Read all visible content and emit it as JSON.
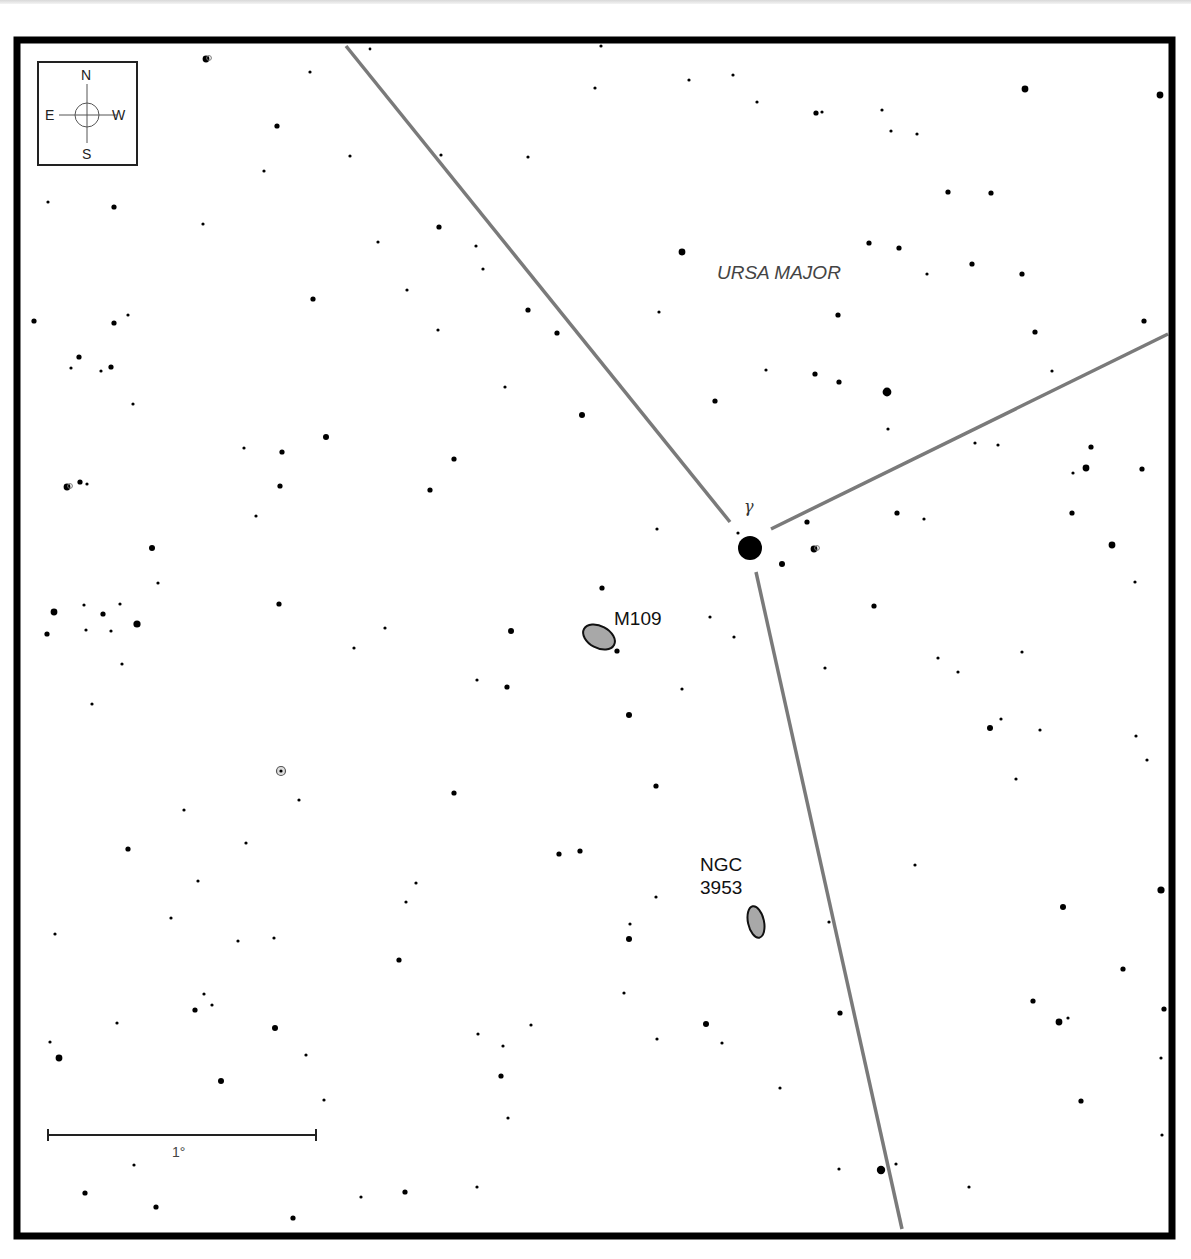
{
  "chart_title": "",
  "compass": {
    "north": "N",
    "south": "S",
    "east": "E",
    "west": "W"
  },
  "constellation": {
    "label": "URSA MAJOR",
    "x": 790,
    "y": 273
  },
  "scale_bar": {
    "label": "1°",
    "x1": 48,
    "x2": 316,
    "y": 1135
  },
  "frame": {
    "left": 17,
    "top": 40,
    "right": 1172,
    "bottom": 1236,
    "stroke": "#000000",
    "width": 7
  },
  "boundary_lines": {
    "color": "#7a7a7a",
    "segments": [
      {
        "x1": 346,
        "y1": 46,
        "x2": 730,
        "y2": 522
      },
      {
        "x1": 771,
        "y1": 529,
        "x2": 1168,
        "y2": 334
      },
      {
        "x1": 756,
        "y1": 572,
        "x2": 902,
        "y2": 1229
      }
    ]
  },
  "labeled_star": {
    "name": "γ",
    "x": 750,
    "y": 548,
    "r": 12,
    "label_x": 744,
    "label_y": 499
  },
  "deep_sky_objects": [
    {
      "name": "M109",
      "label_lines": [
        "M109"
      ],
      "x": 599,
      "y": 637,
      "rx": 17,
      "ry": 11,
      "rotate": 28,
      "label_x": 614,
      "label_y": 609,
      "fill": "#a8a8a8"
    },
    {
      "name": "NGC 3953",
      "label_lines": [
        "NGC",
        "3953"
      ],
      "x": 756,
      "y": 922,
      "rx": 8,
      "ry": 16,
      "rotate": -12,
      "label_x": 700,
      "label_y": 855,
      "fill": "#a8a8a8"
    }
  ],
  "special_markers": [
    {
      "type": "ring-star",
      "x": 281,
      "y": 771
    },
    {
      "type": "double-star",
      "x": 206,
      "y": 59
    },
    {
      "type": "double-star",
      "x": 67,
      "y": 487
    },
    {
      "type": "double-star",
      "x": 814,
      "y": 549
    }
  ],
  "stars": [
    [
      310,
      72,
      1.6
    ],
    [
      350,
      156,
      1.6
    ],
    [
      370,
      49,
      1.4
    ],
    [
      277,
      126,
      2.6
    ],
    [
      264,
      171,
      1.6
    ],
    [
      203,
      224,
      1.6
    ],
    [
      114,
      207,
      2.6
    ],
    [
      48,
      202,
      1.6
    ],
    [
      441,
      155,
      1.6
    ],
    [
      528,
      157,
      1.6
    ],
    [
      601,
      46,
      1.6
    ],
    [
      595,
      88,
      1.6
    ],
    [
      689,
      80,
      1.6
    ],
    [
      733,
      75,
      1.6
    ],
    [
      757,
      102,
      1.6
    ],
    [
      816,
      113,
      2.6
    ],
    [
      822,
      112,
      1.6
    ],
    [
      882,
      110,
      1.6
    ],
    [
      891,
      131,
      1.6
    ],
    [
      917,
      134,
      1.6
    ],
    [
      1025,
      89,
      3.4
    ],
    [
      1160,
      95,
      3.4
    ],
    [
      948,
      192,
      2.6
    ],
    [
      991,
      193,
      2.6
    ],
    [
      869,
      243,
      2.6
    ],
    [
      899,
      248,
      2.6
    ],
    [
      927,
      274,
      1.6
    ],
    [
      972,
      264,
      2.6
    ],
    [
      1022,
      274,
      2.6
    ],
    [
      682,
      252,
      3.4
    ],
    [
      659,
      312,
      1.6
    ],
    [
      838,
      315,
      2.6
    ],
    [
      1035,
      332,
      2.6
    ],
    [
      1144,
      321,
      2.6
    ],
    [
      815,
      374,
      2.6
    ],
    [
      839,
      382,
      2.6
    ],
    [
      766,
      370,
      1.6
    ],
    [
      887,
      392,
      4.4
    ],
    [
      888,
      429,
      1.6
    ],
    [
      715,
      401,
      2.6
    ],
    [
      1052,
      371,
      1.6
    ],
    [
      439,
      227,
      2.6
    ],
    [
      476,
      246,
      1.6
    ],
    [
      483,
      269,
      1.6
    ],
    [
      378,
      242,
      1.6
    ],
    [
      407,
      290,
      1.6
    ],
    [
      313,
      299,
      2.6
    ],
    [
      528,
      310,
      2.6
    ],
    [
      557,
      333,
      2.6
    ],
    [
      438,
      330,
      1.6
    ],
    [
      505,
      387,
      1.6
    ],
    [
      582,
      415,
      3.0
    ],
    [
      454,
      459,
      2.6
    ],
    [
      430,
      490,
      2.6
    ],
    [
      34,
      321,
      2.6
    ],
    [
      114,
      323,
      2.6
    ],
    [
      128,
      315,
      1.6
    ],
    [
      79,
      357,
      2.6
    ],
    [
      71,
      368,
      1.6
    ],
    [
      101,
      371,
      1.6
    ],
    [
      111,
      367,
      2.6
    ],
    [
      133,
      404,
      1.6
    ],
    [
      244,
      448,
      1.6
    ],
    [
      282,
      452,
      2.6
    ],
    [
      326,
      437,
      3.0
    ],
    [
      280,
      486,
      2.6
    ],
    [
      256,
      516,
      1.6
    ],
    [
      80,
      482,
      2.6
    ],
    [
      87,
      484,
      1.6
    ],
    [
      152,
      548,
      3.0
    ],
    [
      158,
      583,
      1.6
    ],
    [
      54,
      612,
      3.4
    ],
    [
      84,
      605,
      1.6
    ],
    [
      103,
      614,
      2.6
    ],
    [
      120,
      604,
      1.6
    ],
    [
      47,
      634,
      2.6
    ],
    [
      86,
      630,
      1.6
    ],
    [
      111,
      631,
      1.6
    ],
    [
      137,
      624,
      3.6
    ],
    [
      122,
      664,
      1.6
    ],
    [
      92,
      704,
      1.6
    ],
    [
      279,
      604,
      2.6
    ],
    [
      385,
      628,
      1.6
    ],
    [
      354,
      648,
      1.6
    ],
    [
      511,
      631,
      3.0
    ],
    [
      602,
      588,
      2.6
    ],
    [
      617,
      651,
      2.6
    ],
    [
      710,
      617,
      1.6
    ],
    [
      734,
      637,
      1.6
    ],
    [
      477,
      680,
      1.6
    ],
    [
      507,
      687,
      2.6
    ],
    [
      682,
      689,
      1.6
    ],
    [
      629,
      715,
      3.0
    ],
    [
      657,
      529,
      1.6
    ],
    [
      738,
      533,
      1.6
    ],
    [
      807,
      522,
      2.6
    ],
    [
      782,
      564,
      3.0
    ],
    [
      897,
      513,
      2.6
    ],
    [
      924,
      519,
      1.6
    ],
    [
      975,
      443,
      1.6
    ],
    [
      998,
      445,
      1.6
    ],
    [
      1091,
      447,
      2.6
    ],
    [
      1086,
      468,
      3.4
    ],
    [
      1073,
      473,
      1.6
    ],
    [
      1142,
      469,
      2.6
    ],
    [
      1072,
      513,
      2.6
    ],
    [
      1112,
      545,
      3.4
    ],
    [
      1135,
      582,
      1.6
    ],
    [
      874,
      606,
      2.6
    ],
    [
      938,
      658,
      1.6
    ],
    [
      958,
      672,
      1.6
    ],
    [
      1022,
      652,
      1.6
    ],
    [
      825,
      668,
      1.6
    ],
    [
      990,
      728,
      3.0
    ],
    [
      1001,
      719,
      1.6
    ],
    [
      1040,
      730,
      1.6
    ],
    [
      1136,
      736,
      1.6
    ],
    [
      1147,
      760,
      1.6
    ],
    [
      1016,
      779,
      1.6
    ],
    [
      656,
      786,
      2.6
    ],
    [
      454,
      793,
      2.6
    ],
    [
      299,
      800,
      1.6
    ],
    [
      184,
      810,
      1.6
    ],
    [
      128,
      849,
      2.6
    ],
    [
      246,
      843,
      1.6
    ],
    [
      559,
      854,
      2.6
    ],
    [
      580,
      851,
      2.6
    ],
    [
      416,
      883,
      1.6
    ],
    [
      406,
      902,
      1.6
    ],
    [
      198,
      881,
      1.6
    ],
    [
      171,
      918,
      1.6
    ],
    [
      55,
      934,
      1.6
    ],
    [
      238,
      941,
      1.6
    ],
    [
      274,
      938,
      1.6
    ],
    [
      399,
      960,
      2.6
    ],
    [
      656,
      897,
      1.6
    ],
    [
      630,
      924,
      1.6
    ],
    [
      629,
      939,
      3.0
    ],
    [
      915,
      865,
      1.6
    ],
    [
      1161,
      890,
      3.6
    ],
    [
      1063,
      907,
      3.0
    ],
    [
      829,
      922,
      1.6
    ],
    [
      1123,
      969,
      2.6
    ],
    [
      1033,
      1001,
      2.6
    ],
    [
      1059,
      1022,
      3.4
    ],
    [
      1068,
      1018,
      1.6
    ],
    [
      1164,
      1009,
      2.6
    ],
    [
      1161,
      1058,
      1.6
    ],
    [
      1162,
      1135,
      1.6
    ],
    [
      1081,
      1101,
      2.6
    ],
    [
      624,
      993,
      1.6
    ],
    [
      706,
      1024,
      3.0
    ],
    [
      722,
      1043,
      1.6
    ],
    [
      657,
      1039,
      1.6
    ],
    [
      840,
      1013,
      2.6
    ],
    [
      204,
      994,
      1.6
    ],
    [
      212,
      1005,
      1.6
    ],
    [
      195,
      1010,
      2.6
    ],
    [
      117,
      1023,
      1.6
    ],
    [
      275,
      1028,
      3.0
    ],
    [
      50,
      1042,
      1.6
    ],
    [
      59,
      1058,
      3.4
    ],
    [
      306,
      1055,
      1.6
    ],
    [
      478,
      1034,
      1.6
    ],
    [
      503,
      1046,
      1.6
    ],
    [
      531,
      1025,
      1.6
    ],
    [
      501,
      1076,
      2.6
    ],
    [
      221,
      1081,
      3.0
    ],
    [
      324,
      1100,
      1.6
    ],
    [
      508,
      1118,
      1.6
    ],
    [
      780,
      1088,
      1.6
    ],
    [
      134,
      1165,
      1.6
    ],
    [
      839,
      1169,
      1.6
    ],
    [
      881,
      1170,
      4.2
    ],
    [
      896,
      1164,
      1.6
    ],
    [
      969,
      1187,
      1.6
    ],
    [
      85,
      1193,
      2.6
    ],
    [
      156,
      1207,
      2.6
    ],
    [
      361,
      1197,
      1.6
    ],
    [
      405,
      1192,
      2.6
    ],
    [
      477,
      1187,
      1.6
    ],
    [
      293,
      1218,
      2.6
    ]
  ]
}
